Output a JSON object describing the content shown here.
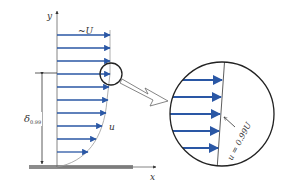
{
  "figure": {
    "labels": {
      "y_axis": "y",
      "x_axis": "x",
      "freestream": "~U",
      "velocity": "u",
      "thickness_symbol": "δ",
      "thickness_subscript": "0.99",
      "edge_condition": "u = 0.99U"
    },
    "colors": {
      "arrow": "#2a57a5",
      "line": "#333333",
      "plate": "#8c8c8c",
      "profile_curve": "#999999"
    },
    "profile_arrow_lengths": [
      53,
      53,
      53,
      53,
      52,
      51,
      49,
      45,
      39,
      31,
      22
    ],
    "zoom_arrow_count": 5
  }
}
